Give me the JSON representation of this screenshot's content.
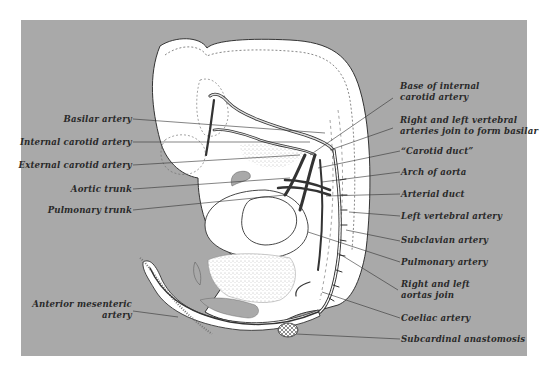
{
  "figure": {
    "background_color": "#a8a8a8",
    "page_color": "#ffffff",
    "tissue_color": "#ffffff",
    "line_color": "#333333",
    "panel": {
      "left": 21,
      "top": 20,
      "right": 527,
      "bottom": 356
    }
  },
  "labels": {
    "left": [
      {
        "id": "basilar-artery",
        "text": "Basilar artery"
      },
      {
        "id": "internal-carotid-artery",
        "text": "Internal carotid artery"
      },
      {
        "id": "external-carotid-artery",
        "text": "External carotid artery"
      },
      {
        "id": "aortic-trunk",
        "text": "Aortic trunk"
      },
      {
        "id": "pulmonary-trunk",
        "text": "Pulmonary trunk"
      },
      {
        "id": "anterior-mesenteric-artery",
        "line1": "Anterior mesenteric",
        "line2": "artery"
      }
    ],
    "right": [
      {
        "id": "base-of-internal-carotid-artery",
        "line1": "Base of internal",
        "line2": "carotid artery"
      },
      {
        "id": "vertebral-arteries-join",
        "line1": "Right and left vertebral",
        "line2": "arteries join to form basilar"
      },
      {
        "id": "carotid-duct",
        "text": "“Carotid duct”"
      },
      {
        "id": "arch-of-aorta",
        "text": "Arch of aorta"
      },
      {
        "id": "arterial-duct",
        "text": "Arterial duct"
      },
      {
        "id": "left-vertebral-artery",
        "text": "Left vertebral artery"
      },
      {
        "id": "subclavian-artery",
        "text": "Subclavian artery"
      },
      {
        "id": "pulmonary-artery",
        "text": "Pulmonary artery"
      },
      {
        "id": "aortas-join",
        "line1": "Right and left",
        "line2": "aortas join"
      },
      {
        "id": "coeliac-artery",
        "text": "Coeliac artery"
      },
      {
        "id": "subcardinal-anastomosis",
        "text": "Subcardinal anastomosis"
      }
    ]
  }
}
